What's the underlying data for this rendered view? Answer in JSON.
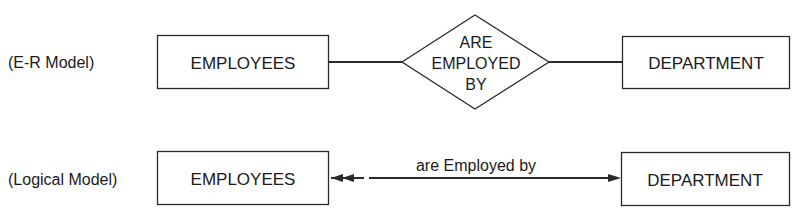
{
  "er_model": {
    "row_label": "(E-R Model)",
    "entity_left": "EMPLOYEES",
    "relationship": [
      "ARE",
      "EMPLOYED",
      "BY"
    ],
    "entity_right": "DEPARTMENT"
  },
  "logical_model": {
    "row_label": "(Logical Model)",
    "entity_left": "EMPLOYEES",
    "relationship_label": "are Employed by",
    "entity_right": "DEPARTMENT",
    "cardinality_left": "many (double arrowhead)",
    "cardinality_right": "one (single arrowhead)"
  },
  "colors": {
    "stroke": "#2a2a2a",
    "text": "#1a1a1a",
    "background": "#ffffff"
  }
}
